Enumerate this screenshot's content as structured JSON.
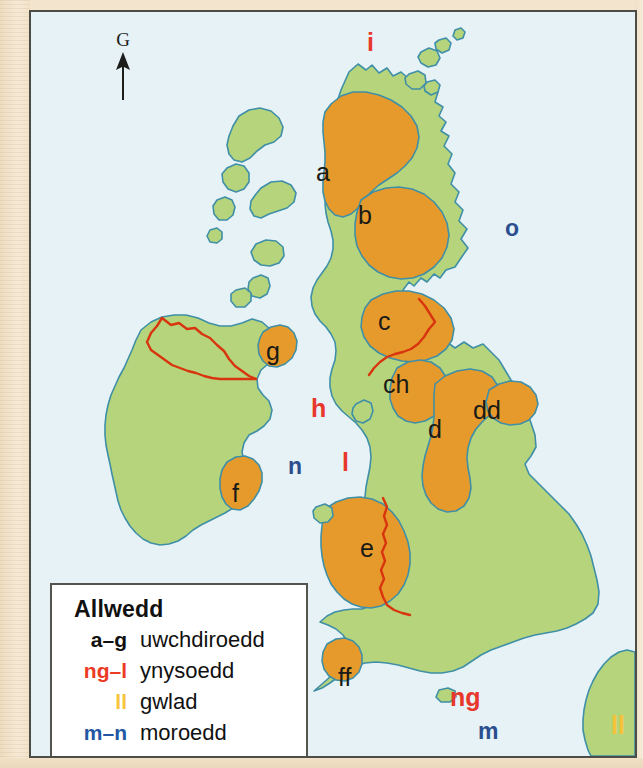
{
  "map": {
    "title": "Physical map of the British Isles (Welsh labels)",
    "north_arrow_letter": "G",
    "colors": {
      "sea": "#e7f2f7",
      "lowland": "#b6d47c",
      "upland": "#e79a2c",
      "coastline": "#3f8fa6",
      "border_red": "#d8350f",
      "frame": "#4e4c46",
      "label_upland": "#1a1a16",
      "label_island": "#e8372b",
      "label_sea": "#2b4f8e",
      "label_country": "#f5c23a"
    },
    "labels": [
      {
        "text": "i",
        "type": "island",
        "x": 367,
        "y": 30
      },
      {
        "text": "a",
        "type": "upland",
        "x": 316,
        "y": 160
      },
      {
        "text": "b",
        "type": "upland",
        "x": 358,
        "y": 203
      },
      {
        "text": "o",
        "type": "sea",
        "x": 505,
        "y": 217
      },
      {
        "text": "c",
        "type": "upland",
        "x": 378,
        "y": 309
      },
      {
        "text": "g",
        "type": "upland",
        "x": 266,
        "y": 339
      },
      {
        "text": "ch",
        "type": "upland",
        "x": 383,
        "y": 372
      },
      {
        "text": "dd",
        "type": "upland",
        "x": 473,
        "y": 398
      },
      {
        "text": "h",
        "type": "island",
        "x": 311,
        "y": 396
      },
      {
        "text": "d",
        "type": "upland",
        "x": 428,
        "y": 417
      },
      {
        "text": "n",
        "type": "sea",
        "x": 288,
        "y": 455
      },
      {
        "text": "l",
        "type": "island",
        "x": 342,
        "y": 450
      },
      {
        "text": "f",
        "type": "upland",
        "x": 232,
        "y": 481
      },
      {
        "text": "e",
        "type": "upland",
        "x": 360,
        "y": 536
      },
      {
        "text": "ff",
        "type": "upland",
        "x": 338,
        "y": 665
      },
      {
        "text": "ng",
        "type": "island",
        "x": 450,
        "y": 685
      },
      {
        "text": "m",
        "type": "sea",
        "x": 478,
        "y": 720
      },
      {
        "text": "ll",
        "type": "country",
        "x": 611,
        "y": 713
      }
    ]
  },
  "legend": {
    "title": "Allwedd",
    "rows": [
      {
        "key": "a–g",
        "desc": "uwchdiroedd",
        "key_class": "k-upland"
      },
      {
        "key": "ng–l",
        "desc": "ynysoedd",
        "key_class": "k-island"
      },
      {
        "key": "ll",
        "desc": "gwlad",
        "key_class": "k-country"
      },
      {
        "key": "m–n",
        "desc": "moroedd",
        "key_class": "k-sea"
      }
    ]
  }
}
